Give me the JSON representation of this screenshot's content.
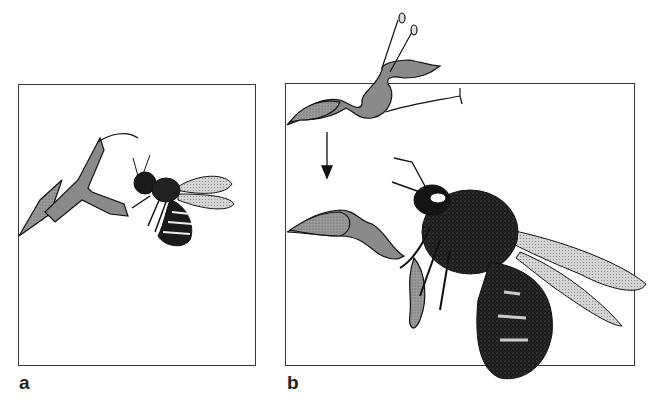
{
  "figure": {
    "panels": [
      {
        "label": "a",
        "description": "bee approaching flower"
      },
      {
        "label": "b",
        "description": "bee pulling flower open; arrow indicates flower bending downward"
      }
    ]
  }
}
